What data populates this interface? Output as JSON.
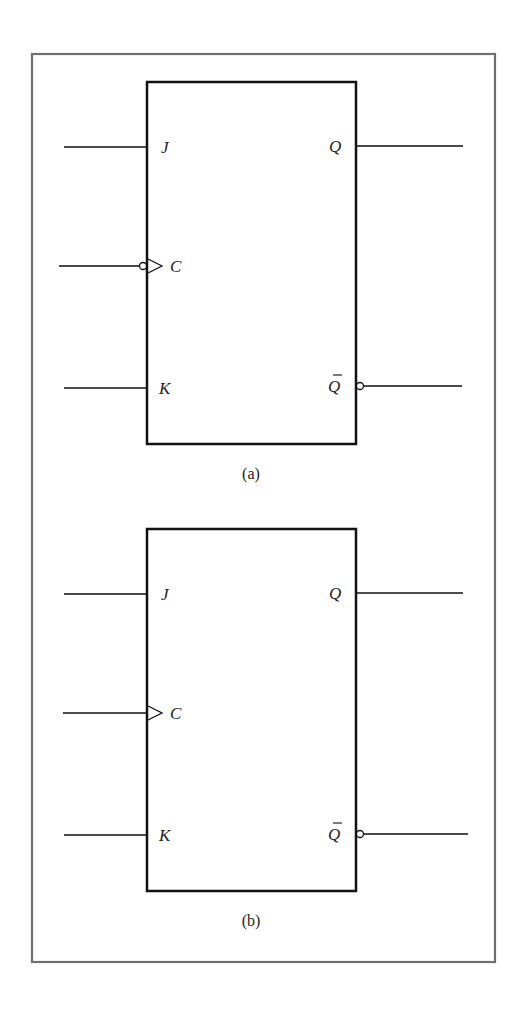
{
  "figure": {
    "frame_color": "#6e6e6e",
    "line_color": "#111111",
    "panels": [
      {
        "caption": "(a)",
        "inputs": {
          "j": "J",
          "c": "C",
          "k": "K"
        },
        "outputs": {
          "q": "Q",
          "qbar": "Q"
        },
        "clock_inverted": true,
        "qbar_bubble": true
      },
      {
        "caption": "(b)",
        "inputs": {
          "j": "J",
          "c": "C",
          "k": "K"
        },
        "outputs": {
          "q": "Q",
          "qbar": "Q"
        },
        "clock_inverted": false,
        "qbar_bubble": true
      }
    ]
  }
}
